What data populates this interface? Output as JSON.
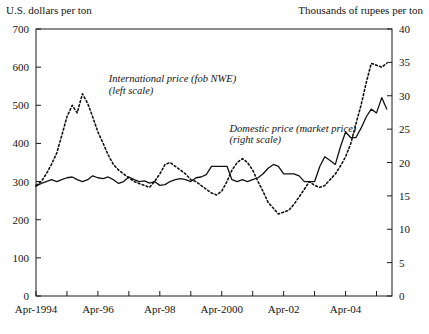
{
  "figure": {
    "left_axis_title": "U.S. dollars per ton",
    "right_axis_title": "Thousands of rupees per ton"
  },
  "labels": {
    "international_line1": "International price (fob NWE)",
    "international_line2": "(left scale)",
    "domestic_line1": "Domestic price (market price)",
    "domestic_line2": "(right scale)"
  },
  "chart_data": {
    "type": "line",
    "title": "",
    "xlabel": "",
    "ylabel": "U.S. dollars per ton",
    "y2label": "Thousands of rupees per ton",
    "grid": false,
    "legend": "inline-annotations",
    "xlim": [
      1994.25,
      2005.75
    ],
    "ylim": [
      0,
      700
    ],
    "y2lim": [
      0,
      40
    ],
    "yticks": [
      0,
      100,
      200,
      300,
      400,
      500,
      600,
      700
    ],
    "y2ticks": [
      0,
      5,
      10,
      15,
      20,
      25,
      30,
      35,
      40
    ],
    "xticks": [
      1994.25,
      1995.25,
      1996.25,
      1997.25,
      1998.25,
      1999.25,
      2000.25,
      2001.25,
      2002.25,
      2003.25,
      2004.25,
      2005.25
    ],
    "xticklabels": [
      "Apr-1994",
      "",
      "Apr-96",
      "",
      "Apr-98",
      "",
      "Apr-2000",
      "",
      "Apr-02",
      "",
      "Apr-04",
      ""
    ],
    "series": [
      {
        "name": "International price (fob NWE)",
        "axis": "left",
        "style": "dotted",
        "units": "U.S. dollars per ton",
        "x": [
          1994.25,
          1994.42,
          1994.58,
          1994.75,
          1994.92,
          1995.08,
          1995.25,
          1995.42,
          1995.58,
          1995.75,
          1995.92,
          1996.08,
          1996.25,
          1996.42,
          1996.58,
          1996.75,
          1996.92,
          1997.08,
          1997.25,
          1997.42,
          1997.58,
          1997.75,
          1997.92,
          1998.08,
          1998.25,
          1998.42,
          1998.58,
          1998.75,
          1998.92,
          1999.08,
          1999.25,
          1999.42,
          1999.58,
          1999.75,
          1999.92,
          2000.08,
          2000.25,
          2000.42,
          2000.58,
          2000.75,
          2000.92,
          2001.08,
          2001.25,
          2001.42,
          2001.58,
          2001.75,
          2001.92,
          2002.08,
          2002.25,
          2002.42,
          2002.58,
          2002.75,
          2002.92,
          2003.08,
          2003.25,
          2003.42,
          2003.58,
          2003.75,
          2003.92,
          2004.08,
          2004.25,
          2004.42,
          2004.58,
          2004.75,
          2004.92,
          2005.08,
          2005.25,
          2005.42,
          2005.58
        ],
        "y": [
          290,
          300,
          320,
          345,
          375,
          420,
          470,
          500,
          480,
          530,
          505,
          470,
          430,
          400,
          370,
          345,
          330,
          320,
          310,
          300,
          295,
          290,
          285,
          300,
          320,
          345,
          350,
          340,
          330,
          320,
          305,
          300,
          290,
          280,
          270,
          265,
          275,
          300,
          330,
          350,
          360,
          350,
          330,
          300,
          275,
          245,
          230,
          215,
          220,
          225,
          240,
          260,
          280,
          300,
          290,
          285,
          290,
          305,
          320,
          340,
          365,
          400,
          450,
          500,
          560,
          610,
          605,
          600,
          610
        ]
      },
      {
        "name": "Domestic price (market price)",
        "axis": "right",
        "style": "solid",
        "units": "Thousands of rupees per ton",
        "x": [
          1994.25,
          1994.42,
          1994.58,
          1994.75,
          1994.92,
          1995.08,
          1995.25,
          1995.42,
          1995.58,
          1995.75,
          1995.92,
          1996.08,
          1996.25,
          1996.42,
          1996.58,
          1996.75,
          1996.92,
          1997.08,
          1997.25,
          1997.42,
          1997.58,
          1997.75,
          1997.92,
          1998.08,
          1998.25,
          1998.42,
          1998.58,
          1998.75,
          1998.92,
          1999.08,
          1999.25,
          1999.42,
          1999.58,
          1999.75,
          1999.92,
          2000.08,
          2000.25,
          2000.42,
          2000.58,
          2000.75,
          2000.92,
          2001.08,
          2001.25,
          2001.42,
          2001.58,
          2001.75,
          2001.92,
          2002.08,
          2002.25,
          2002.42,
          2002.58,
          2002.75,
          2002.92,
          2003.08,
          2003.25,
          2003.42,
          2003.58,
          2003.75,
          2003.92,
          2004.08,
          2004.25,
          2004.42,
          2004.58,
          2004.75,
          2004.92,
          2005.08,
          2005.25,
          2005.42,
          2005.58
        ],
        "y_left_equiv": [
          288,
          295,
          300,
          305,
          300,
          305,
          310,
          312,
          305,
          300,
          305,
          315,
          310,
          308,
          312,
          305,
          295,
          300,
          312,
          305,
          300,
          302,
          296,
          300,
          290,
          292,
          300,
          305,
          308,
          305,
          300,
          310,
          312,
          318,
          340,
          340,
          340,
          340,
          305,
          300,
          305,
          300,
          305,
          310,
          320,
          335,
          345,
          340,
          320,
          320,
          320,
          315,
          300,
          300,
          300,
          340,
          365,
          355,
          345,
          390,
          430,
          415,
          415,
          440,
          470,
          490,
          480,
          520,
          490
        ]
      }
    ],
    "annotations": [
      {
        "text": "International price (fob NWE)",
        "x": 1996.6,
        "y": 560
      },
      {
        "text": "(left scale)",
        "x": 1996.6,
        "y": 530
      },
      {
        "text": "Domestic price (market price)",
        "x": 2000.5,
        "y": 430
      },
      {
        "text": "(right scale)",
        "x": 2000.5,
        "y": 400
      }
    ]
  }
}
